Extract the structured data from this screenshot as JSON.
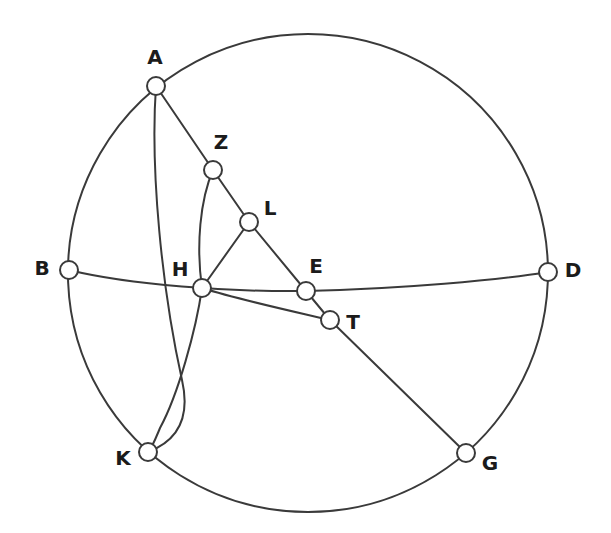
{
  "figure": {
    "width": 611,
    "height": 533,
    "background_color": "#ffffff",
    "stroke_color": "#3a3a3a",
    "label_color": "#1b1b1b",
    "node_fill_color": "#ffffff",
    "node_radius": 9,
    "stroke_width": 2
  },
  "chart_data": {
    "type": "diagram",
    "xlabel": "",
    "ylabel": "",
    "grid": false,
    "legend": "none",
    "xlim": [
      0,
      611
    ],
    "ylim": [
      0,
      533
    ],
    "main_circle": {
      "cx": 308,
      "cy": 273,
      "r": 239
    },
    "points": [
      {
        "id": "A",
        "label": "A",
        "cx": 156,
        "cy": 86,
        "label_x": 155,
        "label_y": 58
      },
      {
        "id": "Z",
        "label": "Z",
        "cx": 213,
        "cy": 170,
        "label_x": 221,
        "label_y": 143
      },
      {
        "id": "L",
        "label": "L",
        "cx": 249,
        "cy": 222,
        "label_x": 270,
        "label_y": 209
      },
      {
        "id": "B",
        "label": "B",
        "cx": 69,
        "cy": 270,
        "label_x": 42,
        "label_y": 269
      },
      {
        "id": "H",
        "label": "H",
        "cx": 202,
        "cy": 288,
        "label_x": 180,
        "label_y": 270
      },
      {
        "id": "E",
        "label": "E",
        "cx": 306,
        "cy": 291,
        "label_x": 316,
        "label_y": 267
      },
      {
        "id": "D",
        "label": "D",
        "cx": 548,
        "cy": 272,
        "label_x": 573,
        "label_y": 271
      },
      {
        "id": "T",
        "label": "T",
        "cx": 330,
        "cy": 320,
        "label_x": 353,
        "label_y": 323
      },
      {
        "id": "K",
        "label": "K",
        "cx": 148,
        "cy": 452,
        "label_x": 123,
        "label_y": 459
      },
      {
        "id": "G",
        "label": "G",
        "cx": 466,
        "cy": 453,
        "label_x": 490,
        "label_y": 464
      }
    ],
    "segments": [
      {
        "id": "A-Z",
        "from": "A",
        "to": "Z",
        "kind": "line"
      },
      {
        "id": "Z-L",
        "from": "Z",
        "to": "L",
        "kind": "line"
      },
      {
        "id": "L-H",
        "from": "L",
        "to": "H",
        "kind": "line"
      },
      {
        "id": "L-E",
        "from": "L",
        "to": "E",
        "kind": "line"
      },
      {
        "id": "T-G",
        "from": "T",
        "to": "G",
        "kind": "line"
      },
      {
        "id": "E-T",
        "from": "E",
        "to": "T",
        "kind": "line"
      },
      {
        "id": "Z-H",
        "from": "Z",
        "to": "H",
        "kind": "arc"
      },
      {
        "id": "B-H-E-D",
        "from": "B",
        "to": "D",
        "kind": "arc",
        "through": [
          "H",
          "E"
        ]
      },
      {
        "id": "H-T",
        "from": "H",
        "to": "T",
        "kind": "arc"
      },
      {
        "id": "A-B",
        "from": "A",
        "to": "B",
        "kind": "arc"
      },
      {
        "id": "A-K",
        "from": "A",
        "to": "K",
        "kind": "arc"
      },
      {
        "id": "H-K",
        "from": "H",
        "to": "K",
        "kind": "arc"
      },
      {
        "id": "B-K",
        "from": "B",
        "to": "K",
        "kind": "arc"
      },
      {
        "id": "D-G",
        "from": "D",
        "to": "G",
        "kind": "arc"
      },
      {
        "id": "K-G",
        "from": "K",
        "to": "G",
        "kind": "arc"
      },
      {
        "id": "A-D-top",
        "from": "A",
        "to": "D",
        "kind": "arc"
      }
    ],
    "paths": {
      "main_circle": "M 308 34 A 240 239 0 1 1 307.9 34",
      "arc_A_B": "M 156 86 C 115 110, 84 185, 69 270",
      "arc_B_K": "M 69 270 C 77 350, 108 415, 148 452",
      "arc_K_G": "M 148 452 C 200 510, 400 516, 466 453",
      "arc_G_D": "M 466 453 C 510 420, 541 345, 548 272",
      "arc_D_A_top": "M 548 272 C 543 175, 470 70, 370 41 C 300 26, 205 50, 156 86",
      "arc_B_D": "M 69 270 C 130 285, 230 292, 306 291 C 400 289, 500 280, 548 272",
      "arc_Z_H": "M 213 170 C 200 200, 196 246, 202 288",
      "arc_H_T": "M 202 288 C 240 300, 296 312, 330 320",
      "arc_A_K": "M 156 86 C 150 170, 162 290, 182 380 C 190 415, 180 440, 148 452",
      "arc_H_K": "M 202 288 C 196 330, 178 395, 160 428 C 155 440, 152 448, 148 452",
      "line_A_Z": "M 156 86 L 213 170",
      "line_Z_L": "M 213 170 L 249 222",
      "line_L_H": "M 249 222 L 202 288",
      "line_L_E": "M 249 222 L 306 291",
      "line_E_T": "M 306 291 L 330 320",
      "line_T_G": "M 330 320 L 466 453"
    }
  }
}
